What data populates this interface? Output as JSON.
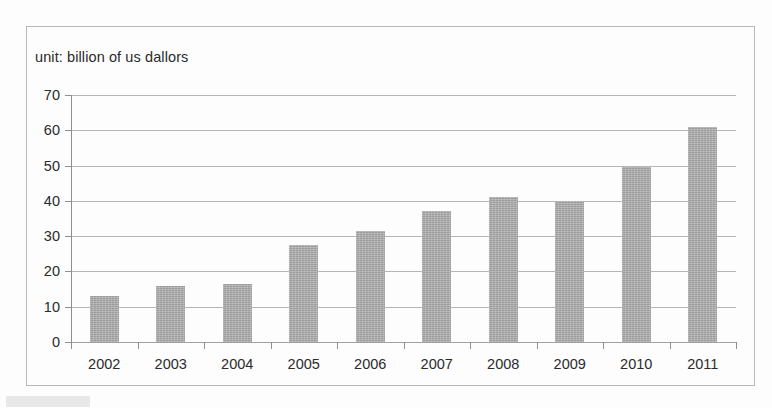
{
  "chart_data": {
    "type": "bar",
    "title": "unit: billion of us dallors",
    "xlabel": "",
    "ylabel": "",
    "categories": [
      "2002",
      "2003",
      "2004",
      "2005",
      "2006",
      "2007",
      "2008",
      "2009",
      "2010",
      "2011"
    ],
    "values": [
      13,
      16,
      16.5,
      27.5,
      31.5,
      37,
      41,
      40,
      49.5,
      61
    ],
    "ylim": [
      0,
      70
    ],
    "ytick_step": 10,
    "yticks": [
      0,
      10,
      20,
      30,
      40,
      50,
      60,
      70
    ],
    "ytick_labels": [
      "0",
      "10",
      "20",
      "30",
      "40",
      "50",
      "60",
      "70"
    ],
    "grid": true,
    "legend": false,
    "series": [
      {
        "name": "value",
        "values": [
          13,
          16,
          16.5,
          27.5,
          31.5,
          37,
          41,
          40,
          49.5,
          61
        ]
      }
    ],
    "bar_color": "#ababab",
    "grid_color": "#a8a8a8",
    "axis_color": "#8f8f8f",
    "frame_color": "#b9b9b9",
    "background_color": "#fdfdfd",
    "text_color": "#2b2b2b"
  }
}
